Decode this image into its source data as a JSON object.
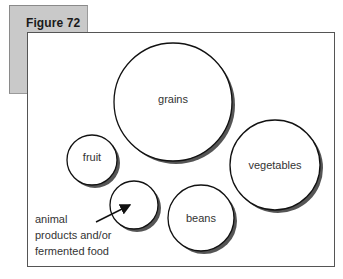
{
  "figure": {
    "title": "Figure 72"
  },
  "circles": [
    {
      "id": "grains",
      "label": "grains",
      "cx": 173,
      "cy": 102,
      "r": 59
    },
    {
      "id": "vegetables",
      "label": "vegetables",
      "cx": 275,
      "cy": 165,
      "r": 45
    },
    {
      "id": "fruit",
      "label": "fruit",
      "cx": 92,
      "cy": 160,
      "r": 25
    },
    {
      "id": "animal",
      "label": "",
      "cx": 134,
      "cy": 205,
      "r": 24
    },
    {
      "id": "beans",
      "label": "beans",
      "cx": 201,
      "cy": 218,
      "r": 33
    }
  ],
  "annotation": {
    "lines": [
      "animal",
      "products and/or",
      "fermented food"
    ]
  },
  "colors": {
    "tab": "#c9c9c9",
    "stroke": "#111111",
    "shadow": "#555555"
  }
}
